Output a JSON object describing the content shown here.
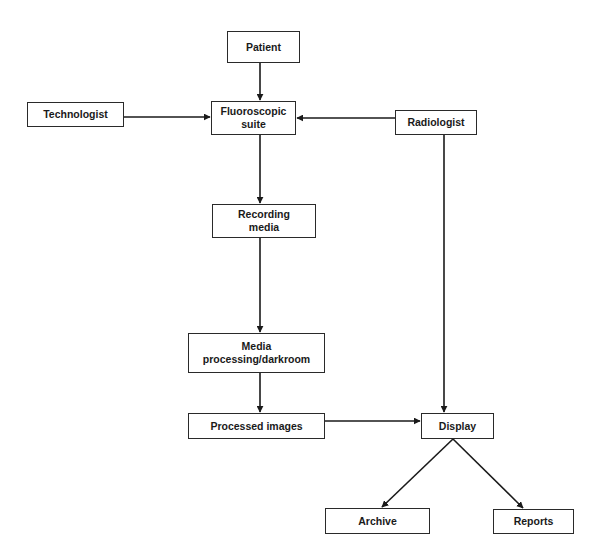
{
  "diagram": {
    "type": "flowchart",
    "colors": {
      "line": "#1a1a1a",
      "box_border": "#2a2a2a",
      "text": "#1a1a1a",
      "background": "#ffffff"
    },
    "nodes": {
      "patient": {
        "label": "Patient",
        "x": 227,
        "y": 31,
        "w": 73,
        "h": 32
      },
      "technologist": {
        "label": "Technologist",
        "x": 27,
        "y": 102,
        "w": 97,
        "h": 25
      },
      "fluoroscopic_suite": {
        "label": "Fluoroscopic\nsuite",
        "x": 211,
        "y": 101,
        "w": 85,
        "h": 34
      },
      "radiologist": {
        "label": "Radiologist",
        "x": 395,
        "y": 110,
        "w": 82,
        "h": 25
      },
      "recording_media": {
        "label": "Recording\nmedia",
        "x": 212,
        "y": 204,
        "w": 104,
        "h": 34
      },
      "media_processing": {
        "label": "Media\nprocessing/darkroom",
        "x": 188,
        "y": 333,
        "w": 137,
        "h": 40
      },
      "processed_images": {
        "label": "Processed images",
        "x": 188,
        "y": 413,
        "w": 137,
        "h": 26
      },
      "display": {
        "label": "Display",
        "x": 421,
        "y": 413,
        "w": 73,
        "h": 26
      },
      "archive": {
        "label": "Archive",
        "x": 325,
        "y": 508,
        "w": 105,
        "h": 26
      },
      "reports": {
        "label": "Reports",
        "x": 493,
        "y": 509,
        "w": 81,
        "h": 25
      }
    },
    "edges": [
      {
        "from": "Patient",
        "to": "Fluoroscopic suite"
      },
      {
        "from": "Technologist",
        "to": "Fluoroscopic suite"
      },
      {
        "from": "Radiologist",
        "to": "Fluoroscopic suite"
      },
      {
        "from": "Fluoroscopic suite",
        "to": "Recording media"
      },
      {
        "from": "Recording media",
        "to": "Media processing/darkroom"
      },
      {
        "from": "Media processing/darkroom",
        "to": "Processed images"
      },
      {
        "from": "Processed images",
        "to": "Display"
      },
      {
        "from": "Radiologist",
        "to": "Display"
      },
      {
        "from": "Display",
        "to": "Archive"
      },
      {
        "from": "Display",
        "to": "Reports"
      }
    ]
  }
}
